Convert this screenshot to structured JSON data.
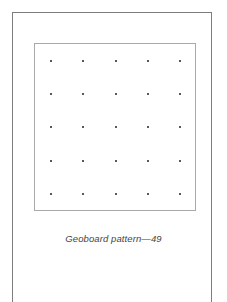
{
  "figure": {
    "caption": "Geoboard pattern—49",
    "grid": {
      "rows": 5,
      "columns": 5,
      "peg_count": 25,
      "band_segments": []
    },
    "colors": {
      "frame": "#7d7d7d",
      "board_border": "#a9a9a9",
      "peg": "#222222",
      "caption": "#444444"
    }
  }
}
